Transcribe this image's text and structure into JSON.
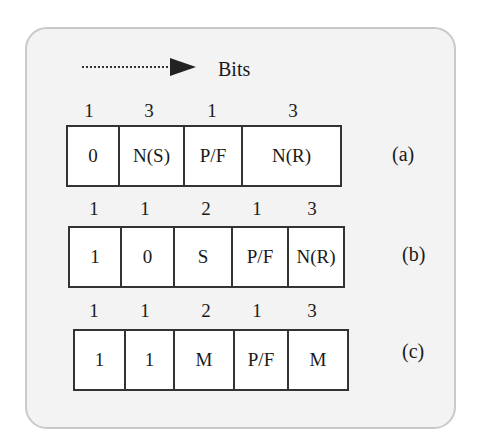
{
  "legend": {
    "arrow_icon": "dotted-arrow-right",
    "label": "Bits"
  },
  "formats": [
    {
      "label": "(a)",
      "fields": [
        {
          "bits": "1",
          "value": "0"
        },
        {
          "bits": "3",
          "value": "N(S)"
        },
        {
          "bits": "1",
          "value": "P/F"
        },
        {
          "bits": "3",
          "value": "N(R)"
        }
      ]
    },
    {
      "label": "(b)",
      "fields": [
        {
          "bits": "1",
          "value": "1"
        },
        {
          "bits": "1",
          "value": "0"
        },
        {
          "bits": "2",
          "value": "S"
        },
        {
          "bits": "1",
          "value": "P/F"
        },
        {
          "bits": "3",
          "value": "N(R)"
        }
      ]
    },
    {
      "label": "(c)",
      "fields": [
        {
          "bits": "1",
          "value": "1"
        },
        {
          "bits": "1",
          "value": "1"
        },
        {
          "bits": "2",
          "value": "M"
        },
        {
          "bits": "1",
          "value": "P/F"
        },
        {
          "bits": "3",
          "value": "M"
        }
      ]
    }
  ]
}
